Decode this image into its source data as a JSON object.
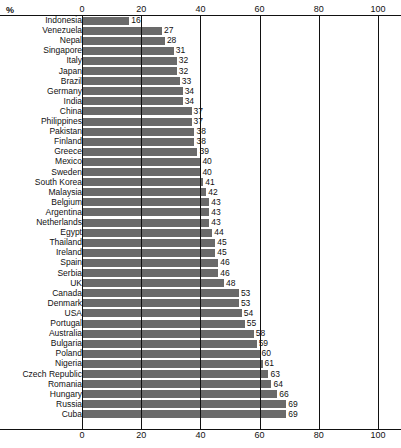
{
  "chart_data": {
    "type": "bar",
    "orientation": "horizontal",
    "title": "",
    "subtitle": "",
    "xlabel": "%",
    "ylabel": "",
    "unit_label": "%",
    "xlim": [
      0,
      100
    ],
    "xticks": [
      0,
      20,
      40,
      60,
      80,
      100
    ],
    "xtick_labels": [
      "0",
      "20",
      "40",
      "60",
      "80",
      "100"
    ],
    "grid": "vertical-major",
    "legend": "none",
    "axis_positions": [
      "top",
      "bottom"
    ],
    "value_labels": true,
    "bar_color": "#6a6a6a",
    "categories": [
      "Indonesia",
      "Venezuela",
      "Nepal",
      "Singapore",
      "Italy",
      "Japan",
      "Brazil",
      "Germany",
      "India",
      "China",
      "Philippines",
      "Pakistan",
      "Finland",
      "Greece",
      "Mexico",
      "Sweden",
      "South Korea",
      "Malaysia",
      "Belgium",
      "Argentina",
      "Netherlands",
      "Egypt",
      "Thailand",
      "Ireland",
      "Spain",
      "Serbia",
      "UK",
      "Canada",
      "Denmark",
      "USA",
      "Portugal",
      "Australia",
      "Bulgaria",
      "Poland",
      "Nigeria",
      "Czech Republic",
      "Romania",
      "Hungary",
      "Russia",
      "Cuba"
    ],
    "values": [
      16,
      27,
      28,
      31,
      32,
      32,
      33,
      34,
      34,
      37,
      37,
      38,
      38,
      39,
      40,
      40,
      41,
      42,
      43,
      43,
      43,
      44,
      45,
      45,
      46,
      46,
      48,
      53,
      53,
      54,
      55,
      58,
      59,
      60,
      61,
      63,
      64,
      66,
      69,
      69
    ]
  }
}
